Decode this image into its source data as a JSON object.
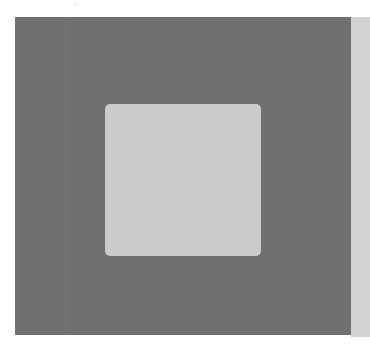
{
  "canvas": {
    "width": 370,
    "height": 349,
    "background_color": "#ffffff"
  },
  "shapes": {
    "outer_panel": {
      "color": "#707070",
      "x": 15,
      "y": 17,
      "width": 336,
      "height": 318
    },
    "right_strip": {
      "color": "#d2d2d2",
      "x": 351,
      "y": 17,
      "width": 19,
      "height": 320
    },
    "inner_square": {
      "color": "#cbcbcb",
      "x": 105,
      "y": 104,
      "width": 156,
      "height": 152,
      "corner_radius": 5
    }
  }
}
